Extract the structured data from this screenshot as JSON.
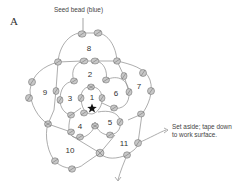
{
  "panel": {
    "letter": "A"
  },
  "callouts": {
    "bead": "Seed bead (blue)",
    "aside": "Set aside; tape down to work surface."
  },
  "cells": [
    {
      "id": "1",
      "label": "1",
      "x": 92,
      "y": 98
    },
    {
      "id": "2",
      "label": "2",
      "x": 90,
      "y": 75
    },
    {
      "id": "3",
      "label": "3",
      "x": 70,
      "y": 99
    },
    {
      "id": "4",
      "label": "4",
      "x": 80,
      "y": 127
    },
    {
      "id": "5",
      "label": "5",
      "x": 110,
      "y": 123
    },
    {
      "id": "6",
      "label": "6",
      "x": 116,
      "y": 94
    },
    {
      "id": "7",
      "label": "7",
      "x": 139,
      "y": 87
    },
    {
      "id": "8",
      "label": "8",
      "x": 89,
      "y": 49
    },
    {
      "id": "9",
      "label": "9",
      "x": 45,
      "y": 93
    },
    {
      "id": "10",
      "label": "10",
      "x": 70,
      "y": 151
    },
    {
      "id": "11",
      "label": "11",
      "x": 124,
      "y": 144
    }
  ],
  "start_marker": {
    "icon": "star-icon",
    "x": 92,
    "y": 108
  },
  "colors": {
    "thread": "#8a8a8a",
    "bead_fill": "#c8c8c8",
    "text": "#333333"
  }
}
